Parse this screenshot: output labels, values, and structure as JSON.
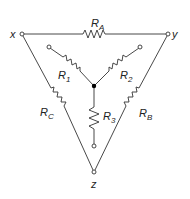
{
  "diagram": {
    "type": "delta-wye resistor network",
    "terminals": {
      "x": "x",
      "y": "y",
      "z": "z"
    },
    "delta_resistors": [
      {
        "name": "R",
        "sub": "A",
        "between": "x-y"
      },
      {
        "name": "R",
        "sub": "B",
        "between": "y-z"
      },
      {
        "name": "R",
        "sub": "C",
        "between": "x-z"
      }
    ],
    "wye_resistors": [
      {
        "name": "R",
        "sub": "1"
      },
      {
        "name": "R",
        "sub": "2"
      },
      {
        "name": "R",
        "sub": "3"
      }
    ]
  }
}
